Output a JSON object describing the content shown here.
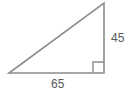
{
  "figure": {
    "name": "right-triangle-diagram",
    "shape": "right triangle",
    "background_color": "#ffffff",
    "stroke_color": "#8c8c8c",
    "text_color": "#595959",
    "stroke_width": 1.6,
    "labels": {
      "vertical_leg": "45",
      "horizontal_leg": "65"
    },
    "geometry": {
      "vertex_left": {
        "x": 9,
        "y": 73
      },
      "vertex_right": {
        "x": 104,
        "y": 73
      },
      "vertex_top": {
        "x": 104,
        "y": 3
      },
      "right_angle_marker": {
        "corner_x": 104,
        "corner_y": 73,
        "size": 11
      }
    }
  }
}
